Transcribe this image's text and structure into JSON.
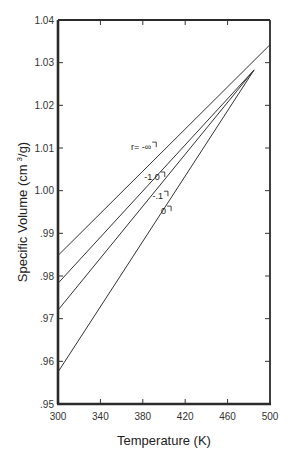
{
  "chart_data": {
    "type": "line",
    "title": "",
    "xlabel": "Temperature (K)",
    "ylabel": "Specific Volume (cm 3 /g)",
    "ylabel_parts": {
      "main": "Specific Volume (cm",
      "sup": "3",
      "end": "/g)"
    },
    "xlim": [
      300,
      500
    ],
    "ylim": [
      0.95,
      1.04
    ],
    "grid": false,
    "legend": "inline labels",
    "x_ticks": [
      300,
      340,
      380,
      420,
      460,
      500
    ],
    "x_tick_labels": [
      "300",
      "340",
      "380",
      "420",
      "460",
      "500"
    ],
    "y_ticks": [
      0.95,
      0.96,
      0.97,
      0.98,
      0.99,
      1.0,
      1.01,
      1.02,
      1.03,
      1.04
    ],
    "y_tick_labels": [
      ".95",
      ".96",
      ".97",
      ".98",
      ".99",
      "1.00",
      "1.01",
      "1.02",
      "1.03",
      "1.04"
    ],
    "series": [
      {
        "name": "r = -∞",
        "label": "r= -∞",
        "x": [
          300,
          500
        ],
        "y": [
          0.9848,
          1.0342
        ]
      },
      {
        "name": "r = -1.0",
        "label": "-1.0",
        "x": [
          300,
          485
        ],
        "y": [
          0.9783,
          1.0283
        ]
      },
      {
        "name": "r = -.1",
        "label": "-.1",
        "x": [
          300,
          485
        ],
        "y": [
          0.972,
          1.0283
        ]
      },
      {
        "name": "r = 0",
        "label": "0",
        "x": [
          300,
          485
        ],
        "y": [
          0.9575,
          1.0283
        ]
      }
    ],
    "annotations": [
      {
        "text": "r= -∞",
        "x": 388,
        "y": 1.0095
      },
      {
        "text": "-1.0",
        "x": 396,
        "y": 1.0025
      },
      {
        "text": "-.1",
        "x": 399,
        "y": 0.998
      },
      {
        "text": "0",
        "x": 402,
        "y": 0.9945
      }
    ]
  }
}
